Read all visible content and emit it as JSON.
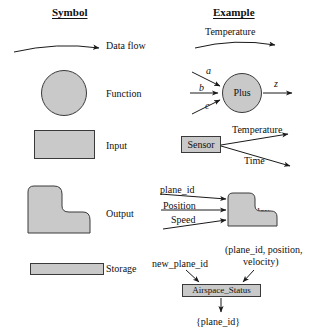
{
  "headers": {
    "symbol": "Symbol",
    "example": "Example"
  },
  "rows": [
    {
      "symbol_label": "Data flow",
      "symbol_kind": "curved-arrow",
      "example": {
        "flow_label": "Temperature"
      }
    },
    {
      "symbol_label": "Function",
      "symbol_kind": "circle",
      "example": {
        "node_label": "Plus",
        "inputs": [
          "a",
          "b",
          "c"
        ],
        "outputs": [
          "z"
        ]
      }
    },
    {
      "symbol_label": "Input",
      "symbol_kind": "rectangle",
      "example": {
        "node_label": "Sensor",
        "outputs": [
          "Temperature",
          "Time"
        ]
      }
    },
    {
      "symbol_label": "Output",
      "symbol_kind": "stepped-rounded",
      "example": {
        "node_label": "Display",
        "inputs": [
          "plane_id",
          "Position",
          "Speed"
        ]
      }
    },
    {
      "symbol_label": "Storage",
      "symbol_kind": "thin-bar",
      "example": {
        "node_label": "Airspace_Status",
        "inputs": [
          "new_plane_id",
          "(plane_id, position,",
          "velocity)"
        ],
        "outputs": [
          "{plane_id}"
        ]
      }
    }
  ],
  "colors": {
    "shape_fill": "#c9c9c9",
    "shape_stroke": "#3a3a3a",
    "line": "#1a1a1a",
    "text": "#111111",
    "background": "#ffffff"
  }
}
